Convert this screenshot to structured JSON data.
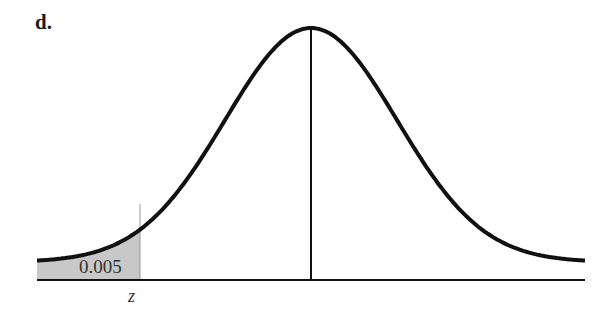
{
  "panel_label": "d.",
  "chart_data": {
    "type": "area",
    "shaded_region": {
      "side": "left",
      "area": 0.005,
      "area_label": "0.005"
    },
    "x_tick_labels": [
      "z"
    ],
    "center_line": true,
    "xlabel": "",
    "ylabel": "",
    "grid": false,
    "colors": {
      "curve": "#111111",
      "shade": "#c8c8c8",
      "axis": "#111111"
    }
  }
}
